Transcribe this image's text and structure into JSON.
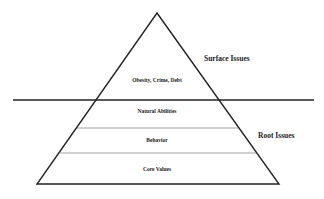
{
  "diagram": {
    "type": "iceberg-pyramid",
    "surface_label": "Surface Issues",
    "root_label": "Root Issues",
    "layers": [
      {
        "label": "Obesity, Crime, Debt",
        "zone": "surface"
      },
      {
        "label": "Natural Abilities",
        "zone": "root"
      },
      {
        "label": "Behavior",
        "zone": "root"
      },
      {
        "label": "Core Values",
        "zone": "root"
      }
    ],
    "colors": {
      "line": "#222222",
      "background": "#ffffff"
    }
  }
}
